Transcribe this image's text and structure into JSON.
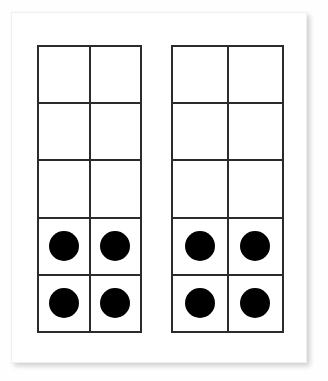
{
  "worksheet": {
    "title": "Ten Frames",
    "background_color": "#fefefe",
    "card_color": "#ffffff",
    "card_border_color": "#f0f0f0"
  },
  "frames": {
    "count": 2,
    "rows_per_frame": 5,
    "columns_per_frame": 2,
    "cells_per_frame": 10,
    "line_color": "#2b2b2b",
    "counter_color": "#000000",
    "items": [
      {
        "name": "left-ten-frame",
        "label": "Left ten frame",
        "filled_count": 4,
        "empty_count": 6,
        "grid": [
          [
            0,
            0
          ],
          [
            0,
            0
          ],
          [
            0,
            0
          ],
          [
            1,
            1
          ],
          [
            1,
            1
          ]
        ]
      },
      {
        "name": "right-ten-frame",
        "label": "Right ten frame",
        "filled_count": 4,
        "empty_count": 6,
        "grid": [
          [
            0,
            0
          ],
          [
            0,
            0
          ],
          [
            0,
            0
          ],
          [
            1,
            1
          ],
          [
            1,
            1
          ]
        ]
      }
    ]
  },
  "chart_data": {
    "type": "bar",
    "subtitle": "",
    "categories": [
      "Left ten frame",
      "Right ten frame"
    ],
    "values": [
      4,
      4
    ],
    "xlabel": "Frame",
    "ylabel": "Counters",
    "ylim": [
      0,
      10
    ],
    "grid": true,
    "legend": "none",
    "annotations": [
      "Each frame is a 2-column by 5-row grid (10 cells).",
      "Counters fill the bottom two rows of each frame.",
      "Total counters shown: 8"
    ]
  }
}
